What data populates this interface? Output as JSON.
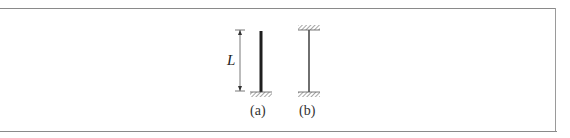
{
  "figure": {
    "dimension_label": "L",
    "columns": [
      {
        "id": "a",
        "label": "(a)",
        "description": "column fixed at base, free at top",
        "stroke_width": 3
      },
      {
        "id": "b",
        "label": "(b)",
        "description": "column fixed at both ends",
        "stroke_width": 1.4
      }
    ]
  },
  "colors": {
    "frame": "#8a8a8a",
    "column": "#222222",
    "hatch": "#666666",
    "text": "#333333"
  }
}
